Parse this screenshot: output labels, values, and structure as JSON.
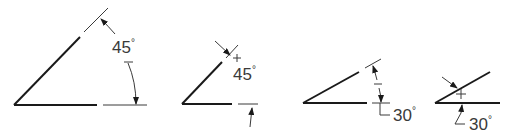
{
  "figure": {
    "colors": {
      "line": "#1a1a1a",
      "thin": "#3a3a3a",
      "background": "#ffffff"
    },
    "examples": [
      {
        "id": 1,
        "angle_value": "45",
        "degree_symbol": "°",
        "placement": "text inside arc, arrows both ends"
      },
      {
        "id": 2,
        "angle_value": "45",
        "degree_symbol": "°",
        "placement": "arrows outside extension lines"
      },
      {
        "id": 3,
        "angle_value": "30",
        "degree_symbol": "°",
        "placement": "leader to text outside"
      },
      {
        "id": 4,
        "angle_value": "30",
        "degree_symbol": "°",
        "placement": "arrows outside with leader text"
      }
    ]
  }
}
